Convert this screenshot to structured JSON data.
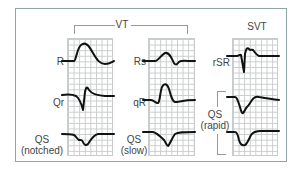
{
  "figure": {
    "groups": [
      {
        "label": "VT"
      },
      {
        "label": "SVT"
      }
    ],
    "columns": [
      {
        "group": "VT",
        "rows": [
          {
            "label": "R",
            "sub": ""
          },
          {
            "label": "Qr",
            "sub": ""
          },
          {
            "label": "QS",
            "sub": "(notched)"
          }
        ]
      },
      {
        "group": "VT",
        "rows": [
          {
            "label": "Rs",
            "sub": ""
          },
          {
            "label": "qR",
            "sub": ""
          },
          {
            "label": "QS",
            "sub": "(slow)"
          }
        ]
      },
      {
        "group": "SVT",
        "rows": [
          {
            "label": "rSR",
            "sub": ""
          },
          {
            "label": "QS",
            "sub": "(rapid)"
          }
        ]
      }
    ],
    "colors": {
      "frame": "#8ea7a4",
      "grid": "#c9cccc",
      "trace": "#111111",
      "bracket": "#999999"
    }
  }
}
